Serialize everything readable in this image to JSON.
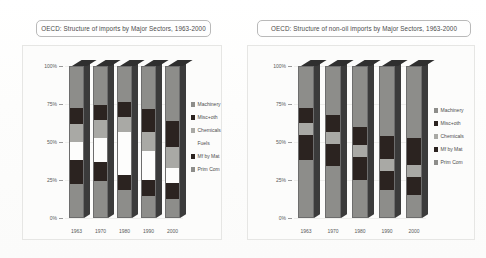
{
  "document": {
    "background_color": "#ffffff",
    "scan_note": "faded scanned page with two stacked bar charts"
  },
  "palette": {
    "machinery": "#8d8d8a",
    "misc_oth": "#2b2320",
    "chemicals": "#a9a9a5",
    "fuels": "#fdfdfc",
    "mf_by_mat": "#2b2320",
    "prim_com": "#8d8d8a",
    "bar_outline": "#6d6d6d",
    "bar_side": "#3b3b3b",
    "bar_top": "#2f2f2f",
    "axis_text": "#5a5a5a",
    "frame_border": "#e6e6e4",
    "title_border": "#b9b9b9"
  },
  "charts": [
    {
      "id": "imports",
      "title": "OECD: Structure of imports by Major Sectors, 1963-2000",
      "legend": [
        {
          "label": "Machinery",
          "color": "#8d8d8a",
          "swatch": true
        },
        {
          "label": "Misc+oth",
          "color": "#2b2320",
          "swatch": true
        },
        {
          "label": "Chemicals",
          "color": "#a9a9a5",
          "swatch": true
        },
        {
          "label": "Fuels",
          "color": "#fdfdfc",
          "swatch": false
        },
        {
          "label": "Mf by Mat",
          "color": "#2b2320",
          "swatch": true
        },
        {
          "label": "Prim Com",
          "color": "#8d8d8a",
          "swatch": true
        }
      ],
      "yticks": [
        "100%",
        "75%",
        "50%",
        "25%",
        "0%"
      ],
      "xlabels": [
        "1963",
        "1970",
        "1980",
        "1990",
        "2000"
      ]
    },
    {
      "id": "non-oil-imports",
      "title": "OECD: Structure of non-oil imports by Major Sectors, 1963-2000",
      "legend": [
        {
          "label": "Machinery",
          "color": "#8d8d8a",
          "swatch": true
        },
        {
          "label": "Misc+oth",
          "color": "#2b2320",
          "swatch": true
        },
        {
          "label": "Chemicals",
          "color": "#a9a9a5",
          "swatch": true
        },
        {
          "label": "Mf by Mat",
          "color": "#2b2320",
          "swatch": true
        },
        {
          "label": "Prim Com",
          "color": "#8d8d8a",
          "swatch": true
        }
      ],
      "yticks": [
        "100%",
        "75%",
        "50%",
        "25%",
        "0%"
      ],
      "xlabels": [
        "1963",
        "1970",
        "1980",
        "1990",
        "2000"
      ]
    }
  ],
  "chart_data": [
    {
      "type": "bar",
      "id": "imports",
      "stacked": true,
      "percent": true,
      "title": "OECD: Structure of imports by Major Sectors, 1963-2000",
      "xlabel": "",
      "ylabel": "",
      "ylim": [
        0,
        100
      ],
      "ytick_values": [
        0,
        25,
        50,
        75,
        100
      ],
      "ytick_labels": [
        "0%",
        "25%",
        "50%",
        "75%",
        "100%"
      ],
      "grid": true,
      "legend_position": "right",
      "categories": [
        "1963",
        "1970",
        "1980",
        "1990",
        "2000"
      ],
      "series": [
        {
          "name": "Prim Com",
          "color": "#8d8d8a",
          "values": [
            22,
            24,
            18,
            14,
            12
          ]
        },
        {
          "name": "Mf by Mat",
          "color": "#2b2320",
          "values": [
            16,
            13,
            10,
            11,
            11
          ]
        },
        {
          "name": "Fuels",
          "color": "#fdfdfc",
          "values": [
            12,
            16,
            29,
            19,
            10
          ]
        },
        {
          "name": "Chemicals",
          "color": "#a9a9a5",
          "values": [
            12,
            12,
            10,
            13,
            14
          ]
        },
        {
          "name": "Misc+oth",
          "color": "#2b2320",
          "values": [
            11,
            10,
            10,
            15,
            17
          ]
        },
        {
          "name": "Machinery",
          "color": "#8d8d8a",
          "values": [
            27,
            25,
            23,
            28,
            36
          ]
        }
      ]
    },
    {
      "type": "bar",
      "id": "non-oil-imports",
      "stacked": true,
      "percent": true,
      "title": "OECD: Structure of non-oil imports by Major Sectors, 1963-2000",
      "xlabel": "",
      "ylabel": "",
      "ylim": [
        0,
        100
      ],
      "ytick_values": [
        0,
        25,
        50,
        75,
        100
      ],
      "ytick_labels": [
        "0%",
        "25%",
        "50%",
        "75%",
        "100%"
      ],
      "grid": true,
      "legend_position": "right",
      "categories": [
        "1963",
        "1970",
        "1980",
        "1990",
        "2000"
      ],
      "series": [
        {
          "name": "Prim Com",
          "color": "#8d8d8a",
          "values": [
            38,
            34,
            25,
            18,
            15
          ]
        },
        {
          "name": "Mf by Mat",
          "color": "#2b2320",
          "values": [
            17,
            15,
            15,
            13,
            12
          ]
        },
        {
          "name": "Chemicals",
          "color": "#a9a9a5",
          "values": [
            8,
            8,
            8,
            8,
            8
          ]
        },
        {
          "name": "Misc+oth",
          "color": "#2b2320",
          "values": [
            10,
            11,
            12,
            15,
            18
          ]
        },
        {
          "name": "Machinery",
          "color": "#8d8d8a",
          "values": [
            27,
            32,
            40,
            46,
            47
          ]
        }
      ]
    }
  ]
}
